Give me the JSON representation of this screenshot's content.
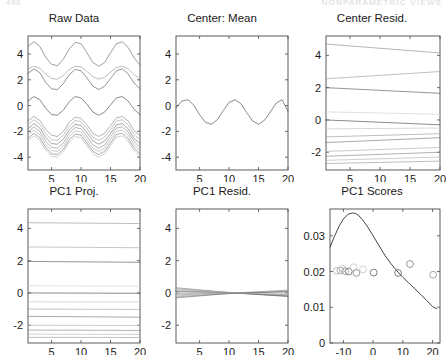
{
  "header": {
    "left": "496",
    "right": "NONPARAMETRIC VIEWS"
  },
  "figure": {
    "rows": 2,
    "cols": 3
  },
  "panels": [
    {
      "key": "raw_data",
      "title": "Raw Data",
      "xticks": [
        5,
        10,
        15,
        20
      ],
      "yticks": [
        -4,
        -2,
        0,
        2,
        4
      ]
    },
    {
      "key": "center_mean",
      "title": "Center: Mean",
      "xticks": [
        5,
        10,
        15,
        20
      ],
      "yticks": [
        -4,
        -2,
        0,
        2,
        4
      ]
    },
    {
      "key": "center_resid",
      "title": "Center Resid.",
      "xticks": [
        5,
        10,
        15,
        20
      ],
      "yticks": [
        -2,
        0,
        2,
        4
      ]
    },
    {
      "key": "pc1_proj",
      "title": "PC1 Proj.",
      "xticks": [
        5,
        10,
        15,
        20
      ],
      "yticks": [
        -2,
        0,
        2,
        4
      ]
    },
    {
      "key": "pc1_resid",
      "title": "PC1 Resid.",
      "xticks": [
        5,
        10,
        15,
        20
      ],
      "yticks": [
        -2,
        0,
        2,
        4
      ]
    },
    {
      "key": "pc1_scores",
      "title": "PC1 Scores",
      "xticks": [
        -10,
        0,
        10,
        20
      ],
      "yticks": [
        0,
        0.01,
        0.02,
        0.03
      ],
      "yticklabels": [
        "0",
        "0.01",
        "0.02",
        "0.03"
      ]
    }
  ],
  "chart_data": [
    {
      "type": "line",
      "key": "raw_data",
      "title": "Raw Data",
      "xlabel": "",
      "ylabel": "",
      "xlim": [
        1,
        20
      ],
      "ylim": [
        -5.0,
        5.4
      ],
      "grid": false,
      "legend": "none",
      "description": "Twenty sinusoidal curves with about four cycles across x=1..20, vertically offset; a dense bundle is concentrated between -4 and -1.5.",
      "x": [
        1,
        2,
        3,
        4,
        5,
        6,
        7,
        8,
        9,
        10,
        11,
        12,
        13,
        14,
        15,
        16,
        17,
        18,
        19,
        20
      ],
      "series": [
        {
          "name": "curve1",
          "offset": 4.0,
          "amplitude": 0.95,
          "gray": "#6b6b6b",
          "values": [
            4.6,
            4.95,
            4.6,
            3.75,
            3.2,
            3.1,
            3.6,
            4.4,
            4.9,
            4.8,
            4.1,
            3.35,
            3.05,
            3.35,
            4.1,
            4.8,
            4.95,
            4.5,
            3.7,
            3.15
          ]
        },
        {
          "name": "curve2",
          "offset": 2.5,
          "amplitude": 0.55,
          "gray": "#9a9a9a",
          "values": [
            2.85,
            3.05,
            2.9,
            2.45,
            2.1,
            2.05,
            2.35,
            2.8,
            3.05,
            3.0,
            2.65,
            2.25,
            2.05,
            2.2,
            2.6,
            2.95,
            3.05,
            2.85,
            2.4,
            2.1
          ]
        },
        {
          "name": "curve3",
          "offset": 2.0,
          "amplitude": 0.85,
          "gray": "#5c5c5c",
          "values": [
            2.5,
            2.85,
            2.55,
            1.8,
            1.3,
            1.25,
            1.7,
            2.4,
            2.8,
            2.7,
            2.15,
            1.5,
            1.25,
            1.5,
            2.1,
            2.7,
            2.85,
            2.45,
            1.75,
            1.3
          ]
        },
        {
          "name": "curve4",
          "offset": 0.0,
          "amplitude": 0.75,
          "gray": "#4a4a4a",
          "values": [
            0.35,
            0.7,
            0.45,
            -0.2,
            -0.7,
            -0.75,
            -0.35,
            0.3,
            0.7,
            0.6,
            0.1,
            -0.5,
            -0.75,
            -0.5,
            0.05,
            0.6,
            0.7,
            0.35,
            -0.3,
            -0.7
          ]
        },
        {
          "name": "curve5",
          "offset": -1.6,
          "amplitude": 0.8,
          "gray": "#8a8a8a",
          "values": [
            -1.2,
            -0.85,
            -1.15,
            -1.85,
            -2.3,
            -2.4,
            -2.0,
            -1.3,
            -0.9,
            -1.0,
            -1.5,
            -2.15,
            -2.4,
            -2.15,
            -1.55,
            -0.95,
            -0.85,
            -1.2,
            -1.95,
            -2.35
          ]
        },
        {
          "name": "curve6",
          "offset": -1.9,
          "amplitude": 0.85,
          "gray": "#a5a5a5",
          "values": [
            -1.5,
            -1.1,
            -1.45,
            -2.15,
            -2.65,
            -2.7,
            -2.3,
            -1.6,
            -1.15,
            -1.25,
            -1.8,
            -2.45,
            -2.7,
            -2.45,
            -1.85,
            -1.2,
            -1.1,
            -1.5,
            -2.25,
            -2.65
          ]
        },
        {
          "name": "curve7",
          "offset": -2.2,
          "amplitude": 0.85,
          "gray": "#777777",
          "values": [
            -1.8,
            -1.4,
            -1.75,
            -2.45,
            -2.95,
            -3.0,
            -2.6,
            -1.9,
            -1.45,
            -1.55,
            -2.1,
            -2.75,
            -3.0,
            -2.75,
            -2.15,
            -1.5,
            -1.4,
            -1.8,
            -2.55,
            -2.95
          ]
        },
        {
          "name": "curve8",
          "offset": -2.5,
          "amplitude": 0.9,
          "gray": "#909090",
          "values": [
            -2.05,
            -1.65,
            -2.0,
            -2.75,
            -3.25,
            -3.3,
            -2.9,
            -2.15,
            -1.7,
            -1.8,
            -2.4,
            -3.05,
            -3.3,
            -3.05,
            -2.4,
            -1.75,
            -1.65,
            -2.05,
            -2.8,
            -3.25
          ]
        },
        {
          "name": "curve9",
          "offset": -2.75,
          "amplitude": 0.9,
          "gray": "#ababab",
          "values": [
            -2.3,
            -1.9,
            -2.25,
            -3.0,
            -3.5,
            -3.55,
            -3.15,
            -2.4,
            -1.95,
            -2.05,
            -2.65,
            -3.3,
            -3.55,
            -3.3,
            -2.65,
            -2.0,
            -1.9,
            -2.3,
            -3.05,
            -3.5
          ]
        },
        {
          "name": "curve10",
          "offset": -3.0,
          "amplitude": 0.9,
          "gray": "#7e7e7e",
          "values": [
            -2.55,
            -2.15,
            -2.5,
            -3.25,
            -3.75,
            -3.8,
            -3.4,
            -2.65,
            -2.2,
            -2.3,
            -2.9,
            -3.55,
            -3.8,
            -3.55,
            -2.9,
            -2.25,
            -2.15,
            -2.55,
            -3.3,
            -3.75
          ]
        },
        {
          "name": "curve11",
          "offset": -3.2,
          "amplitude": 0.9,
          "gray": "#b8b8b8",
          "values": [
            -2.75,
            -2.35,
            -2.7,
            -3.45,
            -3.95,
            -4.0,
            -3.6,
            -2.85,
            -2.4,
            -2.5,
            -3.1,
            -3.75,
            -4.0,
            -3.75,
            -3.1,
            -2.45,
            -2.35,
            -2.75,
            -3.5,
            -3.95
          ]
        }
      ]
    },
    {
      "type": "line",
      "key": "center_mean",
      "title": "Center: Mean",
      "xlabel": "",
      "ylabel": "",
      "xlim": [
        1,
        20
      ],
      "ylim": [
        -5.0,
        5.4
      ],
      "grid": false,
      "legend": "none",
      "description": "Single mean curve oscillating roughly between -1.5 and 0.5 with about four cycles.",
      "x": [
        1,
        2,
        3,
        4,
        5,
        6,
        7,
        8,
        9,
        10,
        11,
        12,
        13,
        14,
        15,
        16,
        17,
        18,
        19,
        20
      ],
      "values": [
        -0.2,
        0.35,
        0.45,
        0.05,
        -0.7,
        -1.3,
        -1.45,
        -1.1,
        -0.4,
        0.25,
        0.45,
        0.15,
        -0.55,
        -1.2,
        -1.45,
        -1.15,
        -0.5,
        0.2,
        0.45,
        -0.45
      ]
    },
    {
      "type": "line",
      "key": "center_resid",
      "title": "Center Resid.",
      "xlabel": "",
      "ylabel": "",
      "xlim": [
        1,
        20
      ],
      "ylim": [
        -3.1,
        5.2
      ],
      "grid": false,
      "legend": "none",
      "description": "Eleven nearly straight residual lines with small positive or negative slopes.",
      "x": [
        1,
        20
      ],
      "series": [
        {
          "name": "r1",
          "gray": "#8d8d8d",
          "values": [
            4.7,
            4.15
          ]
        },
        {
          "name": "r2",
          "gray": "#9e9e9e",
          "values": [
            2.55,
            3.0
          ]
        },
        {
          "name": "r3",
          "gray": "#5a5a5a",
          "values": [
            2.0,
            1.65
          ]
        },
        {
          "name": "r4",
          "gray": "#cfcfcf",
          "values": [
            0.5,
            0.35
          ]
        },
        {
          "name": "r5",
          "gray": "#4e4e4e",
          "values": [
            0.0,
            -0.3
          ]
        },
        {
          "name": "r6",
          "gray": "#c2c2c2",
          "values": [
            -0.55,
            -0.5
          ]
        },
        {
          "name": "r7",
          "gray": "#9a9a9a",
          "values": [
            -1.05,
            -0.85
          ]
        },
        {
          "name": "r8",
          "gray": "#7a7a7a",
          "values": [
            -1.4,
            -1.1
          ]
        },
        {
          "name": "r9",
          "gray": "#acacac",
          "values": [
            -1.95,
            -1.7
          ]
        },
        {
          "name": "r10",
          "gray": "#8a8a8a",
          "values": [
            -2.25,
            -2.0
          ]
        },
        {
          "name": "r11",
          "gray": "#b5b5b5",
          "values": [
            -2.5,
            -2.3
          ]
        },
        {
          "name": "r12",
          "gray": "#9c9c9c",
          "values": [
            -2.7,
            -2.55
          ]
        }
      ]
    },
    {
      "type": "line",
      "key": "pc1_proj",
      "title": "PC1 Proj.",
      "xlabel": "",
      "ylabel": "",
      "xlim": [
        1,
        20
      ],
      "ylim": [
        -3.1,
        5.2
      ],
      "grid": false,
      "legend": "none",
      "description": "Eleven essentially flat horizontal projection lines at constant levels.",
      "x": [
        1,
        20
      ],
      "series": [
        {
          "name": "p1",
          "gray": "#9b9b9b",
          "values": [
            4.35,
            4.3
          ]
        },
        {
          "name": "p2",
          "gray": "#a8a8a8",
          "values": [
            2.85,
            2.8
          ]
        },
        {
          "name": "p3",
          "gray": "#585858",
          "values": [
            1.95,
            1.9
          ]
        },
        {
          "name": "p4",
          "gray": "#d2d2d2",
          "values": [
            0.45,
            0.42
          ]
        },
        {
          "name": "p5",
          "gray": "#4e4e4e",
          "values": [
            0.0,
            -0.02
          ]
        },
        {
          "name": "p6",
          "gray": "#c6c6c6",
          "values": [
            -0.55,
            -0.56
          ]
        },
        {
          "name": "p7",
          "gray": "#a0a0a0",
          "values": [
            -1.0,
            -1.02
          ]
        },
        {
          "name": "p8",
          "gray": "#7c7c7c",
          "values": [
            -1.45,
            -1.5
          ]
        },
        {
          "name": "p9",
          "gray": "#b0b0b0",
          "values": [
            -2.0,
            -2.02
          ]
        },
        {
          "name": "p10",
          "gray": "#888888",
          "values": [
            -2.3,
            -2.32
          ]
        },
        {
          "name": "p11",
          "gray": "#b8b8b8",
          "values": [
            -2.55,
            -2.57
          ]
        },
        {
          "name": "p12",
          "gray": "#9e9e9e",
          "values": [
            -2.75,
            -2.76
          ]
        }
      ]
    },
    {
      "type": "line",
      "key": "pc1_resid",
      "title": "PC1 Resid.",
      "xlabel": "",
      "ylabel": "",
      "xlim": [
        1,
        20
      ],
      "ylim": [
        -3.1,
        5.2
      ],
      "grid": false,
      "legend": "none",
      "description": "Residual lines forming a narrow bowtie pinched near the middle of the x range, all close to zero.",
      "x": [
        1,
        10.5,
        20
      ],
      "series": [
        {
          "name": "q1",
          "gray": "#7a7a7a",
          "values": [
            0.32,
            0.02,
            -0.22
          ]
        },
        {
          "name": "q2",
          "gray": "#9a9a9a",
          "values": [
            0.26,
            0.01,
            -0.18
          ]
        },
        {
          "name": "q3",
          "gray": "#b4b4b4",
          "values": [
            0.2,
            0.01,
            -0.14
          ]
        },
        {
          "name": "q4",
          "gray": "#8c8c8c",
          "values": [
            0.14,
            0.0,
            -0.1
          ]
        },
        {
          "name": "q5",
          "gray": "#5e5e5e",
          "values": [
            0.08,
            0.0,
            -0.2
          ]
        },
        {
          "name": "q6",
          "gray": "#c0c0c0",
          "values": [
            0.02,
            0.0,
            -0.04
          ]
        },
        {
          "name": "q7",
          "gray": "#a4a4a4",
          "values": [
            -0.05,
            0.0,
            0.06
          ]
        },
        {
          "name": "q8",
          "gray": "#8e8e8e",
          "values": [
            -0.12,
            -0.01,
            0.1
          ]
        },
        {
          "name": "q9",
          "gray": "#b8b8b8",
          "values": [
            -0.18,
            -0.01,
            0.14
          ]
        },
        {
          "name": "q10",
          "gray": "#989898",
          "values": [
            -0.24,
            -0.02,
            0.18
          ]
        },
        {
          "name": "q11",
          "gray": "#6e6e6e",
          "values": [
            -0.3,
            -0.02,
            0.08
          ]
        }
      ]
    },
    {
      "type": "scatter",
      "key": "pc1_scores",
      "title": "PC1 Scores",
      "xlabel": "",
      "ylabel": "",
      "xlim": [
        -14.5,
        22.5
      ],
      "ylim": [
        0,
        0.0375
      ],
      "grid": false,
      "legend": "none",
      "description": "Kernel density curve peaking near x=-6 at about 0.036 and decaying to about 0.0095 at x=21, with open circle markers jittered near y=0.020-0.022.",
      "markers": {
        "shape": "open-circle",
        "x": [
          -12.2,
          -11.0,
          -10.2,
          -9.4,
          -8.2,
          -6.6,
          -5.6,
          -3.4,
          0.2,
          8.4,
          12.4,
          20.2
        ],
        "y": [
          0.0202,
          0.0203,
          0.0208,
          0.0201,
          0.02,
          0.0212,
          0.0196,
          0.0206,
          0.0197,
          0.0196,
          0.0221,
          0.0191
        ],
        "gray": [
          "#b9b9b9",
          "#aaaaaa",
          "#c2c2c2",
          "#9d9d9d",
          "#777777",
          "#c8c8c8",
          "#8e8e8e",
          "#cccccc",
          "#6f6f6f",
          "#6a6a6a",
          "#8a8a8a",
          "#9a9a9a"
        ]
      },
      "density_curve": {
        "x": [
          -14.5,
          -13.0,
          -11.5,
          -10.0,
          -8.5,
          -7.0,
          -6.0,
          -5.0,
          -3.5,
          -2.0,
          0.0,
          2.0,
          4.0,
          6.0,
          8.0,
          10.0,
          12.0,
          14.0,
          16.0,
          18.0,
          20.0,
          21.5
        ],
        "y": [
          0.0268,
          0.0298,
          0.0326,
          0.0347,
          0.036,
          0.0364,
          0.0363,
          0.0358,
          0.0344,
          0.0327,
          0.03,
          0.0272,
          0.0245,
          0.0222,
          0.0202,
          0.0184,
          0.0168,
          0.0152,
          0.0136,
          0.0119,
          0.0102,
          0.0095
        ]
      }
    }
  ]
}
